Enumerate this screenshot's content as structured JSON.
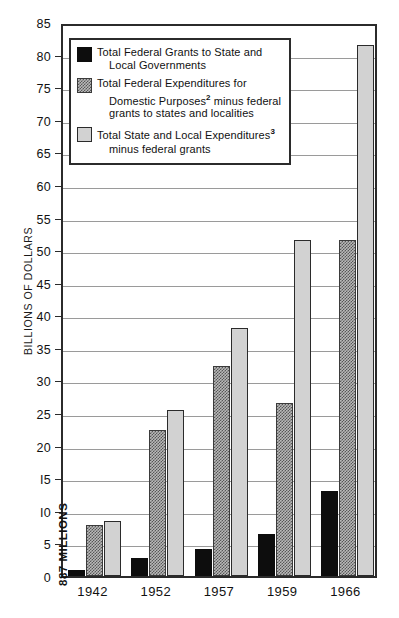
{
  "chart_data": {
    "type": "bar",
    "title": "",
    "xlabel": "",
    "ylabel": "BILLIONS OF DOLLARS",
    "ylim": [
      0,
      85
    ],
    "yticks": [
      0,
      5,
      10,
      15,
      20,
      25,
      30,
      35,
      40,
      45,
      50,
      55,
      60,
      65,
      70,
      75,
      80,
      85
    ],
    "ytick_labels": [
      "0",
      "5",
      "I0",
      "I5",
      "20",
      "25",
      "30",
      "35",
      "40",
      "45",
      "50",
      "55",
      "60",
      "65",
      "70",
      "75",
      "80",
      "85"
    ],
    "categories": [
      "1942",
      "1952",
      "1957",
      "1959",
      "1966"
    ],
    "grid": true,
    "legend_position": "upper-left-inside",
    "series": [
      {
        "name": "Total Federal Grants to State and Local Governments",
        "key": "federal-grants",
        "style": "series-black",
        "color": "#0d0d0d",
        "values": [
          0.887,
          2.8,
          4.1,
          6.4,
          13.0
        ]
      },
      {
        "name": "Total Federal Expenditures for Domestic Purposes minus federal grants to states and localities",
        "key": "federal-domestic-expenditures",
        "style": "series-dither",
        "color": "#757575",
        "values": [
          7.9,
          22.4,
          32.2,
          26.5,
          51.5
        ]
      },
      {
        "name": "Total State and Local Expenditures minus federal grants",
        "key": "state-local-expenditures",
        "style": "series-light",
        "color": "#d2d2d2",
        "values": [
          8.4,
          25.4,
          38.0,
          51.5,
          81.5
        ]
      }
    ],
    "annotations": [
      {
        "key": "first-bar-value",
        "text": "887 MILLIONS",
        "category": "1942",
        "series": "federal-grants"
      }
    ]
  },
  "legend": {
    "items": [
      {
        "style": "series-black",
        "line1": "Total Federal Grants to State and",
        "line2": "Local Governments",
        "line3": "",
        "sup1": "",
        "sup2": "",
        "sup3": ""
      },
      {
        "style": "series-dither",
        "line1": "Total Federal Expenditures for",
        "line2": "Domestic Purposes",
        "sup2": "2",
        "line2b": " minus federal",
        "line3": "grants to states and localities",
        "sup1": "",
        "sup3": ""
      },
      {
        "style": "series-light",
        "line1": "Total State and Local Expenditures",
        "sup1": "3",
        "line2": "minus federal grants",
        "line3": "",
        "sup2": "",
        "sup3": ""
      }
    ]
  }
}
